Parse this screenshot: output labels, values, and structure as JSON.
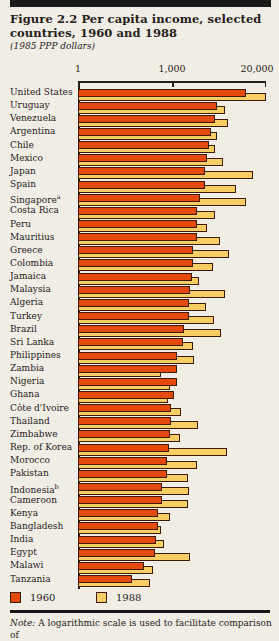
{
  "figure": {
    "title_line1": "Figure 2.2  Per capita income, selected",
    "title_line2": "countries, 1960 and 1988",
    "subtitle": "(1985 PPP dollars)",
    "note_label": "Note:",
    "note_text": " A logarithmic scale is used to facilitate comparison of"
  },
  "legend": {
    "items": [
      {
        "label": "1960",
        "color": "#E5490D"
      },
      {
        "label": "1988",
        "color": "#F7CE63"
      }
    ]
  },
  "chart_data": {
    "type": "bar",
    "orientation": "horizontal",
    "scale": "logarithmic",
    "unit": "1985 PPP dollars",
    "title": "Per capita income, selected countries, 1960 and 1988",
    "axis_ticks": [
      "1",
      "1,000",
      "20,000"
    ],
    "axis_tick_positions": [
      0,
      0.5,
      1
    ],
    "axis_max": 20000,
    "grid": false,
    "legend_position": "bottom",
    "categories": [
      "United States",
      "Uruguay",
      "Venezuela",
      "Argentina",
      "Chile",
      "Mexico",
      "Japan",
      "Spain",
      "Singapore",
      "Costa Rica",
      "Peru",
      "Mauritius",
      "Greece",
      "Colombia",
      "Jamaica",
      "Malaysia",
      "Algeria",
      "Turkey",
      "Brazil",
      "Sri Lanka",
      "Philippines",
      "Zambia",
      "Nigeria",
      "Ghana",
      "Côte d'Ivoire",
      "Thailand",
      "Zimbabwe",
      "Rep. of Korea",
      "Morocco",
      "Pakistan",
      "Indonesia",
      "Cameroon",
      "Kenya",
      "Bangladesh",
      "India",
      "Egypt",
      "Malawi",
      "Tanzania"
    ],
    "footnote_markers": {
      "Singapore": "a",
      "Indonesia": "b"
    },
    "series": [
      {
        "name": "1960",
        "color": "#E5490D",
        "values": [
          10500,
          4240,
          3940,
          3440,
          3260,
          3030,
          2900,
          2890,
          2450,
          2240,
          2200,
          2190,
          1980,
          1940,
          1880,
          1780,
          1730,
          1720,
          1480,
          1440,
          1190,
          1180,
          1170,
          1050,
          960,
          955,
          940,
          920,
          860,
          855,
          735,
          730,
          645,
          640,
          600,
          580,
          410,
          280
        ]
      },
      {
        "name": "1988",
        "color": "#F7CE63",
        "values": [
          19800,
          5420,
          5960,
          4160,
          3940,
          5040,
          13100,
          7700,
          10600,
          3940,
          3030,
          4620,
          6220,
          3740,
          2390,
          5420,
          2910,
          3860,
          4770,
          1980,
          2040,
          710,
          940,
          890,
          1340,
          2320,
          1290,
          5720,
          2200,
          1650,
          1740,
          1690,
          940,
          700,
          775,
          1780,
          540,
          500
        ]
      }
    ]
  }
}
